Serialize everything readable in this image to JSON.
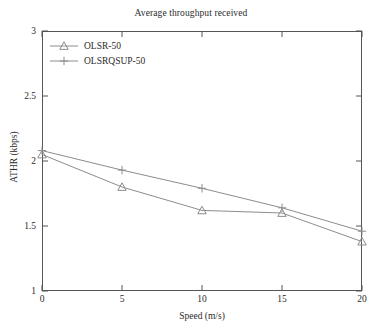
{
  "chart_data": {
    "type": "line",
    "title": "Average throughput received",
    "xlabel": "Speed (m/s)",
    "ylabel": "ATHR (kbps)",
    "x": [
      0,
      5,
      10,
      15,
      20
    ],
    "xlim": [
      0,
      20
    ],
    "ylim": [
      1,
      3
    ],
    "xticks": [
      "0",
      "5",
      "10",
      "15",
      "20"
    ],
    "yticks": [
      "1",
      "1.5",
      "2",
      "2.5",
      "3"
    ],
    "grid": false,
    "legend_position": "upper-left",
    "series": [
      {
        "name": "OLSR-50",
        "marker": "triangle",
        "color": "#8c8c8c",
        "values": [
          2.05,
          1.8,
          1.62,
          1.6,
          1.38
        ]
      },
      {
        "name": "OLSRQSUP-50",
        "marker": "plus",
        "color": "#8c8c8c",
        "values": [
          2.08,
          1.93,
          1.79,
          1.64,
          1.46
        ]
      }
    ]
  },
  "legend": {
    "items": [
      {
        "label": "OLSR-50",
        "marker": "triangle-marker-icon"
      },
      {
        "label": "OLSRQSUP-50",
        "marker": "plus-marker-icon"
      }
    ]
  },
  "axes": {
    "frame_color": "#555555",
    "tick_color": "#555555"
  }
}
